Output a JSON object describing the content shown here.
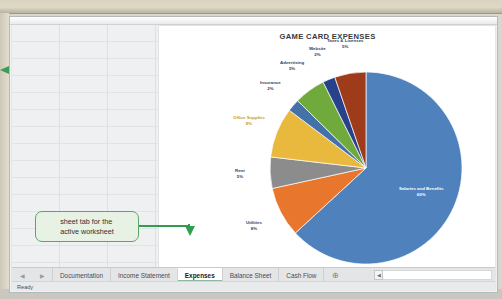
{
  "window": {
    "status_text": "Ready"
  },
  "chart_data": {
    "type": "pie",
    "title": "GAME CARD EXPENSES",
    "xlabel": "",
    "ylabel": "",
    "legend_position": "none",
    "grid": false,
    "labels_show_percent": true,
    "categories": [
      "Salaries and Benefits",
      "Utilities",
      "Rent",
      "Office Supplies",
      "Insurance",
      "Advertising",
      "Website",
      "Taxes & Licenses"
    ],
    "values": [
      60,
      8,
      5,
      8,
      2,
      5,
      2,
      5
    ],
    "percent_labels": [
      "60%",
      "8%",
      "5%",
      "8%",
      "2%",
      "5%",
      "2%",
      "5%"
    ],
    "colors": [
      "#4f81bd",
      "#e8762c",
      "#8c8c8c",
      "#e8b93c",
      "#4472a8",
      "#70a93c",
      "#27418c",
      "#9e3b1a"
    ],
    "slices": [
      {
        "name": "Salaries and Benefits",
        "percent": "60%",
        "value": 60,
        "color": "#4f81bd"
      },
      {
        "name": "Utilities",
        "percent": "8%",
        "value": 8,
        "color": "#e8762c"
      },
      {
        "name": "Rent",
        "percent": "5%",
        "value": 5,
        "color": "#8c8c8c"
      },
      {
        "name": "Office Supplies",
        "percent": "8%",
        "value": 8,
        "color": "#e8b93c"
      },
      {
        "name": "Insurance",
        "percent": "2%",
        "value": 2,
        "color": "#4472a8"
      },
      {
        "name": "Advertising",
        "percent": "5%",
        "value": 5,
        "color": "#70a93c"
      },
      {
        "name": "Website",
        "percent": "2%",
        "value": 2,
        "color": "#27418c"
      },
      {
        "name": "Taxes & Licenses",
        "percent": "5%",
        "value": 5,
        "color": "#9e3b1a"
      }
    ]
  },
  "annotation": {
    "callout_line1": "sheet tab for the",
    "callout_line2": "active worksheet",
    "accent_color": "#2f9e4f"
  },
  "tabs": {
    "nav_prev": "◀",
    "nav_next": "▶",
    "items": [
      {
        "label": "Documentation",
        "active": false
      },
      {
        "label": "Income Statement",
        "active": false
      },
      {
        "label": "Expenses",
        "active": true
      },
      {
        "label": "Balance Sheet",
        "active": false
      },
      {
        "label": "Cash Flow",
        "active": false
      }
    ],
    "add_sheet_label": "⊕"
  },
  "scrollbar": {
    "left_arrow": "◀"
  }
}
